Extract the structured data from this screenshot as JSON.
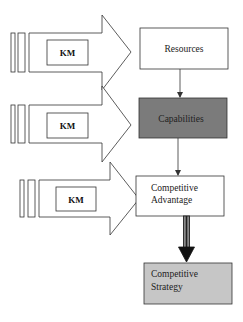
{
  "diagram": {
    "colors": {
      "stroke": "#333333",
      "capabilities_fill": "#7b7b7b",
      "strategy_fill": "#c6c6c6",
      "white": "#ffffff"
    },
    "km_arrows": [
      {
        "label": "KM",
        "target": "Resources"
      },
      {
        "label": "KM",
        "target": "Capabilities"
      },
      {
        "label": "KM",
        "target": "Competitive Advantage"
      }
    ],
    "boxes": [
      {
        "id": "resources",
        "lines": [
          "Resources"
        ]
      },
      {
        "id": "capabilities",
        "lines": [
          "Capabilities"
        ]
      },
      {
        "id": "competitive-advantage",
        "lines": [
          "Competitive",
          "Advantage"
        ]
      },
      {
        "id": "competitive-strategy",
        "lines": [
          "Competitive",
          "Strategy"
        ]
      }
    ],
    "connections": [
      {
        "from": "Resources",
        "to": "Capabilities",
        "style": "thin"
      },
      {
        "from": "Capabilities",
        "to": "Competitive Advantage",
        "style": "thin"
      },
      {
        "from": "Competitive Advantage",
        "to": "Competitive Strategy",
        "style": "thick"
      }
    ]
  }
}
